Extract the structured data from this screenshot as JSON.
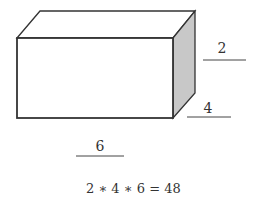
{
  "diagram": {
    "type": "rectangular-prism",
    "colors": {
      "stroke": "#333333",
      "side_face": "#c8c8c8",
      "front_face": "#ffffff",
      "top_face": "#ffffff"
    },
    "labels": {
      "height": "2",
      "depth": "4",
      "width": "6"
    },
    "equation": "2 ∗ 4 ∗ 6 = 48"
  }
}
